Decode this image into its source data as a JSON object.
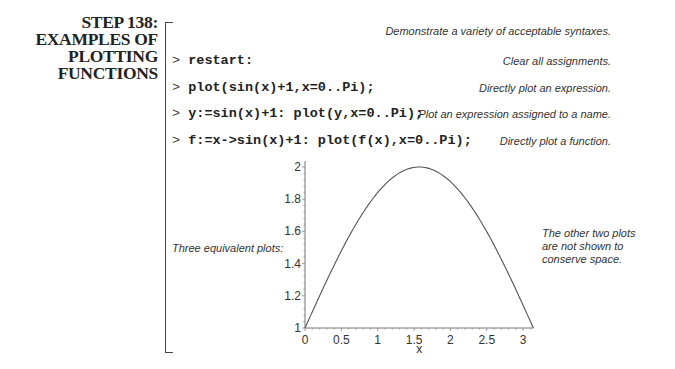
{
  "step": {
    "title_lines": [
      "STEP 138:",
      "EXAMPLES OF",
      "PLOTTING",
      "FUNCTIONS"
    ]
  },
  "intro_note": "Demonstrate a variety of acceptable syntaxes.",
  "commands": [
    {
      "prompt": ">",
      "code": "restart:",
      "note": "Clear all assignments."
    },
    {
      "prompt": ">",
      "code": "plot(sin(x)+1,x=0..Pi);",
      "note": "Directly plot an expression."
    },
    {
      "prompt": ">",
      "code": "y:=sin(x)+1: plot(y,x=0..Pi);",
      "note": "Plot an expression assigned to a name."
    },
    {
      "prompt": ">",
      "code": "f:=x->sin(x)+1: plot(f(x),x=0..Pi);",
      "note": "Directly plot a function."
    }
  ],
  "left_note": "Three equivalent plots:",
  "right_note_lines": [
    "The other two plots",
    "are not shown to",
    "conserve space."
  ],
  "chart_data": {
    "type": "line",
    "title": "",
    "function": "sin(x)+1",
    "xlabel": "x",
    "ylabel": "",
    "xlim": [
      0,
      3.14159
    ],
    "ylim": [
      1,
      2
    ],
    "x_ticks": [
      "0",
      "0.5",
      "1",
      "1.5",
      "2",
      "2.5",
      "3"
    ],
    "y_ticks": [
      "1",
      "1.2",
      "1.4",
      "1.6",
      "1.8",
      "2"
    ],
    "grid": false,
    "legend": null,
    "series": [
      {
        "name": "sin(x)+1",
        "x": [
          0,
          0.25,
          0.5,
          0.75,
          1.0,
          1.25,
          1.5,
          1.5708,
          1.75,
          2.0,
          2.25,
          2.5,
          2.75,
          3.0,
          3.14159
        ],
        "y": [
          1.0,
          1.247,
          1.479,
          1.682,
          1.841,
          1.949,
          1.997,
          2.0,
          1.984,
          1.909,
          1.778,
          1.598,
          1.382,
          1.141,
          1.0
        ]
      }
    ]
  }
}
